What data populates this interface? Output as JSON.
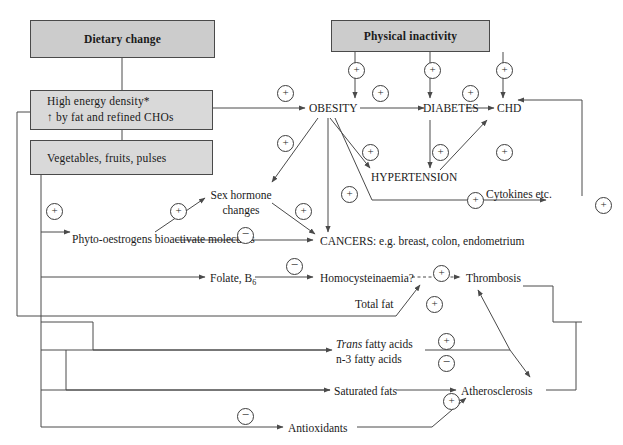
{
  "figure": {
    "box_fill": "#cccccc",
    "box_fill_soft": "#d9d9d9",
    "line_color": "#4a4a4a",
    "canvas": {
      "width": 623,
      "height": 445
    }
  },
  "boxes": {
    "dietary_change": "Dietary change",
    "physical_inactivity": "Physical inactivity",
    "high_energy_line1": "High energy density*",
    "high_energy_line2": "↑ by fat and refined CHOs",
    "vegetables": "Vegetables, fruits, pulses"
  },
  "nodes": {
    "obesity": "OBESITY",
    "diabetes": "DIABETES",
    "chd": "CHD",
    "hypertension": "HYPERTENSION",
    "cytokines": "Cytokines etc.",
    "sex_hormone_l1": "Sex hormone",
    "sex_hormone_l2": "changes",
    "phyto_l1": "Phyto-oestrogens",
    "phyto_l2": "bioactivate molecules",
    "cancers": "CANCERS: e.g. breast, colon, endometrium",
    "folate": "Folate, B",
    "folate_sub": "6",
    "homocysteinaemia": "Homocysteinaemia?",
    "thrombosis": "Thrombosis",
    "total_fat": "Total fat",
    "trans_fatty_italic": "Trans",
    "trans_fatty_rest": " fatty acids",
    "n3_fatty": "n-3 fatty acids",
    "saturated_fats": "Saturated fats",
    "atherosclerosis": "Atherosclerosis",
    "antioxidants": "Antioxidants"
  },
  "signs": {
    "plus": "+",
    "minus": "−",
    "list": [
      {
        "id": "pi-obesity",
        "symbol": "+",
        "x": 348,
        "y": 62
      },
      {
        "id": "pi-diabetes",
        "symbol": "+",
        "x": 424,
        "y": 62
      },
      {
        "id": "pi-chd",
        "symbol": "+",
        "x": 496,
        "y": 62
      },
      {
        "id": "hed-obesity",
        "symbol": "+",
        "x": 277,
        "y": 85
      },
      {
        "id": "obesity-diabetes",
        "symbol": "+",
        "x": 372,
        "y": 85
      },
      {
        "id": "diabetes-chd",
        "symbol": "+",
        "x": 462,
        "y": 85
      },
      {
        "id": "hed-sexhorm",
        "symbol": "+",
        "x": 277,
        "y": 135
      },
      {
        "id": "obesity-htn",
        "symbol": "+",
        "x": 362,
        "y": 144
      },
      {
        "id": "diabetes-htn",
        "symbol": "+",
        "x": 432,
        "y": 144
      },
      {
        "id": "htn-chd",
        "symbol": "+",
        "x": 496,
        "y": 144
      },
      {
        "id": "obesity-cancers",
        "symbol": "+",
        "x": 341,
        "y": 186
      },
      {
        "id": "veg-phyto",
        "symbol": "+",
        "x": 46,
        "y": 203
      },
      {
        "id": "phyto-sexhorm",
        "symbol": "+",
        "x": 170,
        "y": 203
      },
      {
        "id": "sexhorm-cancers",
        "symbol": "+",
        "x": 295,
        "y": 203
      },
      {
        "id": "cytokines-chd",
        "symbol": "+",
        "x": 467,
        "y": 192
      },
      {
        "id": "right-loop",
        "symbol": "+",
        "x": 595,
        "y": 197
      },
      {
        "id": "phyto-cancers",
        "symbol": "−",
        "x": 237,
        "y": 227
      },
      {
        "id": "folate-homocys",
        "symbol": "−",
        "x": 286,
        "y": 258
      },
      {
        "id": "homocys-thromb",
        "symbol": "+",
        "x": 433,
        "y": 265
      },
      {
        "id": "totalfat-thromb",
        "symbol": "+",
        "x": 426,
        "y": 296
      },
      {
        "id": "trans-plus",
        "symbol": "+",
        "x": 438,
        "y": 333
      },
      {
        "id": "n3-minus",
        "symbol": "−",
        "x": 438,
        "y": 355
      },
      {
        "id": "satfat-athero",
        "symbol": "+",
        "x": 443,
        "y": 393
      },
      {
        "id": "antiox-athero",
        "symbol": "−",
        "x": 237,
        "y": 408
      }
    ]
  }
}
